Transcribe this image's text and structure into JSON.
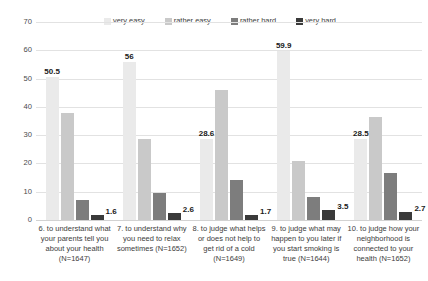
{
  "chart_data": {
    "type": "bar",
    "title": "",
    "subtitle": "",
    "xlabel": "",
    "ylabel": "",
    "ylim": [
      0,
      70
    ],
    "ytick_step": 10,
    "yticks": [
      "70",
      "60",
      "50",
      "40",
      "30",
      "20",
      "10",
      "0"
    ],
    "grid": true,
    "legend_position": "top",
    "orientation": "vertical",
    "grouped": true,
    "categories": [
      "6. to understand what your parents tell you about your health (N=1647)",
      "7. to understand why you need to relax sometimes (N=1652)",
      "8. to judge what helps or does not help to get rid of a cold (N=1649)",
      "9. to judge what may happen to you later if you start smoking is true (N=1644)",
      "10. to judge how your neighborhood is connected to your health (N=1652)"
    ],
    "category_lines": [
      [
        "6. to understand what",
        "your parents tell you",
        "about your health",
        "(N=1647)"
      ],
      [
        "7. to understand why",
        "you need to relax",
        "sometimes (N=1652)"
      ],
      [
        "8. to judge what helps",
        "or does not help to",
        "get rid of a cold",
        "(N=1649)"
      ],
      [
        "9. to judge what may",
        "happen to you later if",
        "you start smoking is",
        "true (N=1644)"
      ],
      [
        "10. to judge how your",
        "neighborhood is",
        "connected to your",
        "health (N=1652)"
      ]
    ],
    "series": [
      {
        "name": "very easy",
        "color": "#6f6f6f",
        "pattern": "crosshatch",
        "values": [
          50.5,
          56,
          28.6,
          59.9,
          28.5
        ],
        "labels": [
          "50.5",
          "56",
          "28.6",
          "59.9",
          "28.5"
        ],
        "show_labels": true
      },
      {
        "name": "rather easy",
        "color": "#c9c9c9",
        "pattern": "solid",
        "values": [
          38,
          28.5,
          46,
          21,
          36.5
        ],
        "labels": [
          "",
          "",
          "",
          "",
          ""
        ],
        "show_labels": false
      },
      {
        "name": "rather hard",
        "color": "#7d7d7d",
        "pattern": "solid",
        "values": [
          7,
          9.5,
          14,
          8,
          16.5
        ],
        "labels": [
          "",
          "",
          "",
          "",
          ""
        ],
        "show_labels": false
      },
      {
        "name": "very hard",
        "color": "#3a3a3a",
        "pattern": "solid",
        "values": [
          1.6,
          2.6,
          1.7,
          3.5,
          2.7
        ],
        "labels": [
          "1.6",
          "2.6",
          "1.7",
          "3.5",
          "2.7"
        ],
        "show_labels": true
      }
    ]
  },
  "legend": {
    "items": [
      {
        "label": "very easy",
        "swatch": "very-easy"
      },
      {
        "label": "rather easy",
        "swatch": "rather-easy"
      },
      {
        "label": "rather hard",
        "swatch": "rather-hard"
      },
      {
        "label": "very hard",
        "swatch": "very-hard"
      }
    ]
  }
}
